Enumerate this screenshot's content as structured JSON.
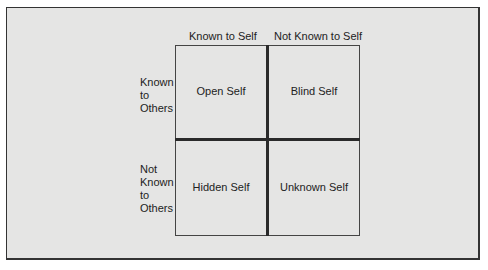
{
  "diagram": {
    "type": "johari-window",
    "columns": [
      "Known to Self",
      "Not Known to Self"
    ],
    "rows": [
      "Known\nto\nOthers",
      "Not\nKnown\nto\nOthers"
    ],
    "row_lines": [
      [
        "Known",
        "to",
        "Others"
      ],
      [
        "Not",
        "Known",
        "to",
        "Others"
      ]
    ],
    "cells": [
      [
        "Open Self",
        "Blind Self"
      ],
      [
        "Hidden Self",
        "Unknown Self"
      ]
    ]
  }
}
